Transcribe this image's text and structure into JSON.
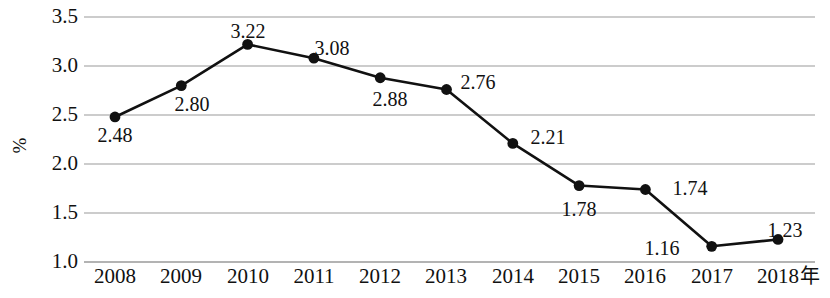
{
  "chart_data": {
    "type": "line",
    "title": "",
    "xlabel": "年",
    "ylabel": "%",
    "categories": [
      "2008",
      "2009",
      "2010",
      "2011",
      "2012",
      "2013",
      "2014",
      "2015",
      "2016",
      "2017",
      "2018"
    ],
    "values": [
      2.48,
      2.8,
      3.22,
      3.08,
      2.88,
      2.76,
      2.21,
      1.78,
      1.74,
      1.16,
      1.23
    ],
    "data_labels": [
      "2.48",
      "2.80",
      "3.22",
      "3.08",
      "2.88",
      "2.76",
      "2.21",
      "1.78",
      "1.74",
      "1.16",
      "1.23"
    ],
    "ylim": [
      1.0,
      3.5
    ],
    "y_ticks": [
      "3.5",
      "3.0",
      "2.5",
      "2.0",
      "1.5",
      "1.0"
    ],
    "y_tick_values": [
      3.5,
      3.0,
      2.5,
      2.0,
      1.5,
      1.0
    ],
    "grid": true,
    "grid_axis": "y",
    "legend": false,
    "legend_position": "none",
    "series_color": "#111111",
    "marker": "circle",
    "marker_color": "#111111",
    "grid_color": "#9a9a9a",
    "background": "#ffffff"
  },
  "axes": {
    "y_title": "%",
    "x_unit": "年"
  }
}
